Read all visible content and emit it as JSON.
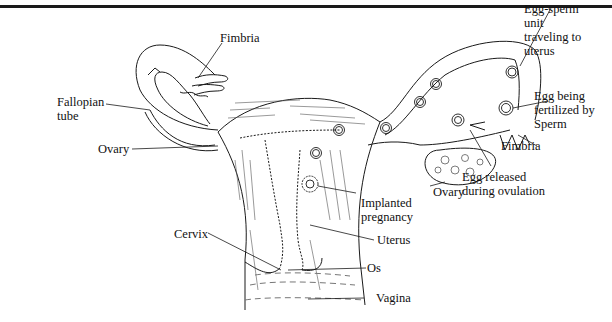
{
  "diagram": {
    "type": "anatomical-illustration",
    "labels": {
      "fimbria_left": "Fimbria",
      "fallopian_tube": [
        "Fallopian",
        "tube"
      ],
      "ovary_left": "Ovary",
      "cervix": "Cervix",
      "egg_sperm_unit": [
        "Egg-sperm",
        "unit",
        "traveling to",
        "uterus"
      ],
      "egg_fertilized": [
        "Egg being",
        "fertilized by",
        "Sperm"
      ],
      "fimbria_right": "Fimbria",
      "egg_released": [
        "Egg released",
        "during ovulation"
      ],
      "ovary_right": "Ovary",
      "implanted_pregnancy": [
        "Implanted",
        "pregnancy"
      ],
      "uterus": "Uterus",
      "os": "Os",
      "vagina": "Vagina"
    }
  },
  "colors": {
    "line": "#1a1a1a",
    "background": "#ffffff"
  }
}
